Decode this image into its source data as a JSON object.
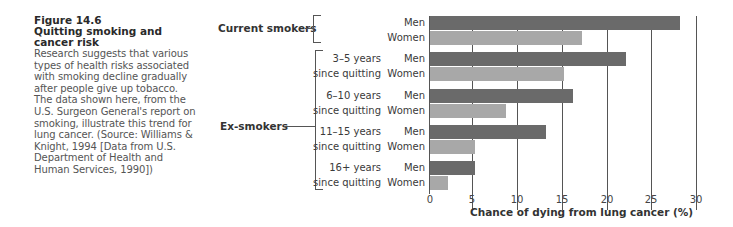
{
  "caption": {
    "figure_number": "Figure 14.6",
    "title_line1": "Quitting smoking and",
    "title_line2": "cancer risk",
    "body": "Research suggests that various types of health risks associated with smoking decline gradually after people give up tobacco. The data shown here, from the U.S. Surgeon General's report on smoking, illustrate this trend for lung cancer. (Source: Williams & Knight, 1994 [Data from U.S. Department of Health and Human Services, 1990])"
  },
  "groups": {
    "current": "Current smokers",
    "ex": "Ex-smokers"
  },
  "rows": [
    {
      "line1": "",
      "line2": ""
    },
    {
      "line1": "3–5 years",
      "line2": "since quitting"
    },
    {
      "line1": "6–10 years",
      "line2": "since quitting"
    },
    {
      "line1": "11–15 years",
      "line2": "since quitting"
    },
    {
      "line1": "16+ years",
      "line2": "since quitting"
    }
  ],
  "sex_labels": {
    "men": "Men",
    "women": "Women"
  },
  "colors": {
    "men": "#6a6a6a",
    "women": "#a8a8a8"
  },
  "chart_data": {
    "type": "bar",
    "orientation": "horizontal",
    "title": "Quitting smoking and cancer risk",
    "xlabel": "Chance of dying from lung cancer (%)",
    "ylabel": "",
    "categories": [
      "Current smokers",
      "3–5 years since quitting",
      "6–10 years since quitting",
      "11–15 years since quitting",
      "16+ years since quitting"
    ],
    "series": [
      {
        "name": "Men",
        "values": [
          28,
          22,
          16,
          13,
          5
        ]
      },
      {
        "name": "Women",
        "values": [
          17,
          15,
          8.5,
          5,
          2
        ]
      }
    ],
    "xlim": [
      0,
      30
    ],
    "xticks": [
      "0",
      "5",
      "10",
      "15",
      "20",
      "25",
      "30"
    ],
    "grid": "vertical gridlines at ticks",
    "legend": "none (Men/Women labels beside bars)",
    "group_labels": [
      "Current smokers",
      "Ex-smokers"
    ]
  }
}
